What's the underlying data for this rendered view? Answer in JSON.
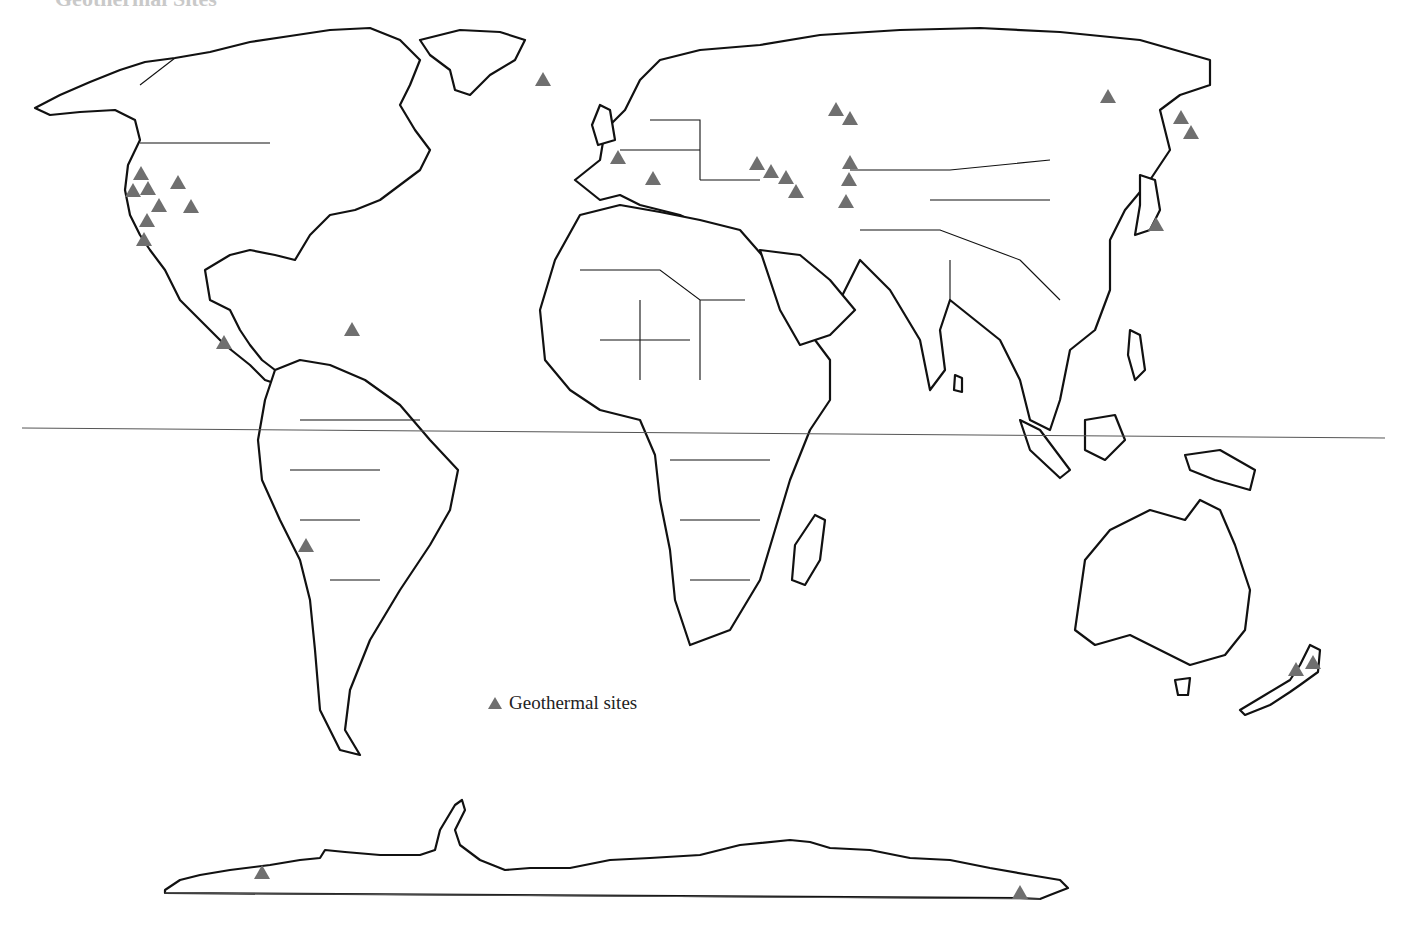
{
  "map": {
    "title": "Geothermal Sites",
    "legend": {
      "icon": "triangle-marker-icon",
      "label": "Geothermal sites",
      "marker_color": "#6f6f6f"
    },
    "reference_lines": [
      {
        "name": "equator",
        "x1": 22,
        "y1": 428,
        "x2": 1385,
        "y2": 438
      },
      {
        "name": "antarctica-baseline",
        "x1": 165,
        "y1": 893,
        "x2": 1040,
        "y2": 899
      }
    ],
    "sites": [
      {
        "region": "Iceland",
        "x": 543,
        "y": 80
      },
      {
        "region": "Western USA",
        "x": 141,
        "y": 174
      },
      {
        "region": "Western USA",
        "x": 133,
        "y": 191
      },
      {
        "region": "Western USA",
        "x": 148,
        "y": 189
      },
      {
        "region": "Western USA",
        "x": 178,
        "y": 183
      },
      {
        "region": "Western USA",
        "x": 159,
        "y": 206
      },
      {
        "region": "Western USA",
        "x": 191,
        "y": 207
      },
      {
        "region": "Western USA",
        "x": 147,
        "y": 221
      },
      {
        "region": "Baja California",
        "x": 144,
        "y": 240
      },
      {
        "region": "Central America",
        "x": 224,
        "y": 343
      },
      {
        "region": "Lesser Antilles",
        "x": 352,
        "y": 330
      },
      {
        "region": "Andes",
        "x": 306,
        "y": 546
      },
      {
        "region": "France",
        "x": 618,
        "y": 158
      },
      {
        "region": "Italy",
        "x": 653,
        "y": 179
      },
      {
        "region": "Caucasus",
        "x": 757,
        "y": 164
      },
      {
        "region": "Caucasus",
        "x": 771,
        "y": 172
      },
      {
        "region": "Caucasus",
        "x": 786,
        "y": 178
      },
      {
        "region": "Caucasus",
        "x": 796,
        "y": 192
      },
      {
        "region": "Ural Region",
        "x": 836,
        "y": 110
      },
      {
        "region": "Ural Region",
        "x": 850,
        "y": 119
      },
      {
        "region": "Central Asia",
        "x": 850,
        "y": 163
      },
      {
        "region": "Central Asia",
        "x": 849,
        "y": 180
      },
      {
        "region": "Central Asia",
        "x": 846,
        "y": 202
      },
      {
        "region": "Eastern Siberia",
        "x": 1108,
        "y": 97
      },
      {
        "region": "Kamchatka",
        "x": 1181,
        "y": 118
      },
      {
        "region": "Kamchatka",
        "x": 1191,
        "y": 133
      },
      {
        "region": "Japan",
        "x": 1156,
        "y": 225
      },
      {
        "region": "New Zealand",
        "x": 1296,
        "y": 670
      },
      {
        "region": "New Zealand",
        "x": 1313,
        "y": 663
      },
      {
        "region": "Antarctica West",
        "x": 262,
        "y": 873
      },
      {
        "region": "Antarctica East",
        "x": 1020,
        "y": 893
      }
    ]
  }
}
